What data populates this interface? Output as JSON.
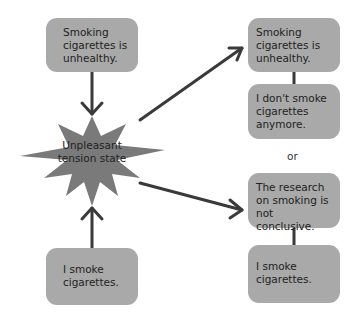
{
  "diagram": {
    "left_top_box": "Smoking cigarettes is unhealthy.",
    "left_bottom_box": "I smoke cigarettes.",
    "center_state": "Unpleasant tension state",
    "right_option_1": {
      "top": "Smoking cigarettes is unhealthy.",
      "bottom": "I don't smoke cigarettes anymore."
    },
    "separator": "or",
    "right_option_2": {
      "top": "The research on smoking is not conclusive.",
      "bottom": "I smoke cigarettes."
    },
    "colors": {
      "box": "#a9a9a9",
      "star": "#7a7a7a",
      "arrow": "#3a3a3a"
    }
  }
}
